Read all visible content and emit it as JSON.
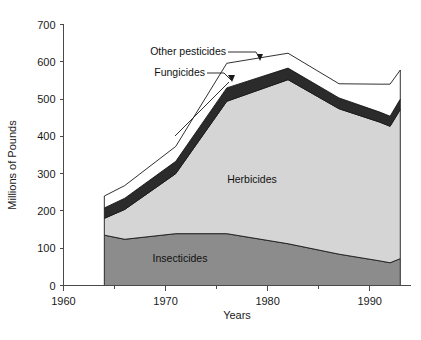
{
  "chart_data": {
    "type": "area",
    "stacked": true,
    "title": "",
    "xlabel": "Years",
    "ylabel": "Millions of Pounds",
    "xlim": [
      1960,
      1994
    ],
    "ylim": [
      0,
      700
    ],
    "xticks": [
      1960,
      1970,
      1980,
      1990
    ],
    "xtick_labels": [
      "1960",
      "1970",
      "1980",
      "1990"
    ],
    "xminor_ticks": [
      1965,
      1975,
      1985
    ],
    "yticks": [
      0,
      100,
      200,
      300,
      400,
      500,
      600,
      700
    ],
    "ytick_labels": [
      "0",
      "100",
      "200",
      "300",
      "400",
      "500",
      "600",
      "700"
    ],
    "grid": false,
    "legend_position": "inline-annotations",
    "x": [
      1964,
      1966,
      1971,
      1976,
      1982,
      1987,
      1991,
      1992,
      1993
    ],
    "series": [
      {
        "name": "Insecticides",
        "color": "#8c8c8c",
        "values": [
          135,
          124,
          139,
          139,
          112,
          84,
          66,
          61,
          72
        ]
      },
      {
        "name": "Herbicides",
        "color": "#d5d5d5",
        "values": [
          45,
          80,
          161,
          355,
          440,
          390,
          372,
          366,
          400
        ]
      },
      {
        "name": "Fungicides",
        "color": "#2b2b2b",
        "values": [
          28,
          30,
          33,
          36,
          31,
          29,
          27,
          27,
          28
        ]
      },
      {
        "name": "Other pesticides",
        "color": "#ffffff",
        "values": [
          32,
          34,
          40,
          66,
          40,
          38,
          75,
          86,
          78
        ]
      }
    ],
    "annotations": [
      {
        "text": "Other pesticides",
        "target_series": "Other pesticides"
      },
      {
        "text": "Fungicides",
        "target_series": "Fungicides"
      },
      {
        "text": "Herbicides",
        "target_series": "Herbicides"
      },
      {
        "text": "Insecticides",
        "target_series": "Insecticides"
      }
    ]
  },
  "axis": {
    "ylabel": "Millions of Pounds",
    "xlabel": "Years"
  },
  "colors": {
    "insecticides": "#8c8c8c",
    "herbicides": "#d5d5d5",
    "fungicides": "#2b2b2b",
    "other_pesticides": "#ffffff",
    "axis": "#4a4a4a",
    "text": "#1a1a1a",
    "background": "#ffffff"
  }
}
